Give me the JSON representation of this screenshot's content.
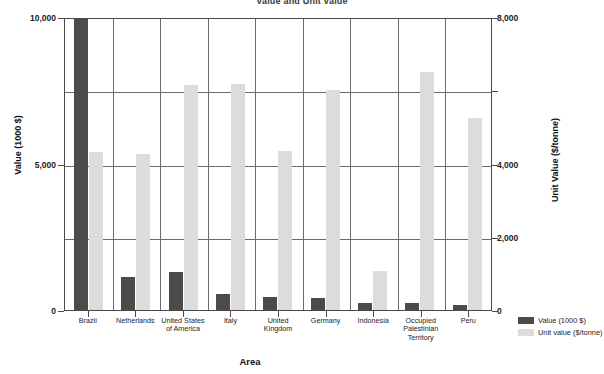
{
  "chart_data": {
    "type": "bar",
    "title": "Value and Unit value",
    "xlabel": "Area",
    "ylabel": "Value (1000 $)",
    "y2label": "Unit Value ($/tonne)",
    "categories": [
      "Brazil",
      "Netherlands",
      "United States\nof America",
      "Italy",
      "United\nKingdom",
      "Germany",
      "Indonesia",
      "Occupied\nPalestinian\nTerritory",
      "Peru"
    ],
    "series": [
      {
        "name": "Value (1000 $)",
        "axis": "left",
        "color": "#4d4a47",
        "values": [
          9980,
          1130,
          1300,
          550,
          430,
          400,
          240,
          250,
          180
        ]
      },
      {
        "name": "Unit value ($/tonne)",
        "axis": "right",
        "color": "#dcdcdc",
        "values": [
          4320,
          4260,
          6140,
          6170,
          4340,
          6000,
          1060,
          6500,
          5240
        ]
      }
    ],
    "ylim": [
      0,
      10000
    ],
    "y2lim": [
      0,
      8000
    ],
    "yticks": [
      0,
      5000,
      10000
    ],
    "ytick_labels": [
      "0",
      "5,000",
      "10,000"
    ],
    "y2ticks": [
      0,
      2000,
      4000,
      6000,
      8000
    ],
    "y2tick_labels": [
      "0",
      "2,000",
      "4,000",
      "",
      "8,000"
    ],
    "grid": true,
    "legend_position": "bottom-right"
  },
  "legend": {
    "items": [
      {
        "label": "Value (1000 $)",
        "color": "#4d4a47"
      },
      {
        "label": "Unit value ($/tonne)",
        "color": "#dcdcdc"
      }
    ]
  }
}
